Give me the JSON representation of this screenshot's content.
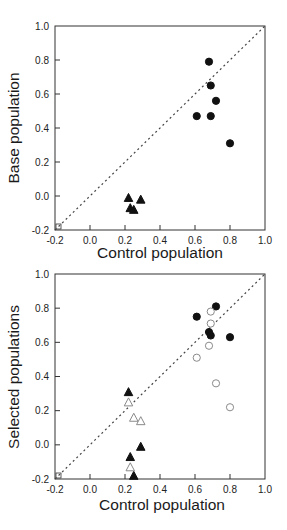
{
  "chart_data": [
    {
      "type": "scatter",
      "title": "",
      "xlabel": "Control population",
      "ylabel": "Base population",
      "xlim": [
        -0.2,
        1.0
      ],
      "ylim": [
        -0.2,
        1.0
      ],
      "xticks": [
        "-0.2",
        "0.0",
        "0.2",
        "0.4",
        "0.6",
        "0.8",
        "1.0"
      ],
      "yticks": [
        "-0.2",
        "0.0",
        "0.2",
        "0.4",
        "0.6",
        "0.8",
        "1.0"
      ],
      "grid": false,
      "legend": null,
      "reference_line": {
        "style": "dotted",
        "from": [
          -0.2,
          -0.2
        ],
        "to": [
          1.0,
          1.0
        ],
        "label": "y = x"
      },
      "series": [
        {
          "name": "filled circles",
          "marker": "circle",
          "filled": true,
          "points": [
            [
              0.68,
              0.79
            ],
            [
              0.69,
              0.65
            ],
            [
              0.72,
              0.56
            ],
            [
              0.61,
              0.47
            ],
            [
              0.69,
              0.47
            ],
            [
              0.8,
              0.31
            ]
          ]
        },
        {
          "name": "filled triangles",
          "marker": "triangle",
          "filled": true,
          "points": [
            [
              0.22,
              -0.01
            ],
            [
              0.29,
              -0.02
            ],
            [
              0.23,
              -0.07
            ],
            [
              0.25,
              -0.08
            ]
          ]
        }
      ]
    },
    {
      "type": "scatter",
      "title": "",
      "xlabel": "Control population",
      "ylabel": "Selected populations",
      "xlim": [
        -0.2,
        1.0
      ],
      "ylim": [
        -0.2,
        1.0
      ],
      "xticks": [
        "-0.2",
        "0.0",
        "0.2",
        "0.4",
        "0.6",
        "0.8",
        "1.0"
      ],
      "yticks": [
        "-0.2",
        "0.0",
        "0.2",
        "0.4",
        "0.6",
        "0.8",
        "1.0"
      ],
      "grid": false,
      "legend": null,
      "reference_line": {
        "style": "dotted",
        "from": [
          -0.2,
          -0.2
        ],
        "to": [
          1.0,
          1.0
        ],
        "label": "y = x"
      },
      "series": [
        {
          "name": "filled circles",
          "marker": "circle",
          "filled": true,
          "points": [
            [
              0.72,
              0.81
            ],
            [
              0.61,
              0.75
            ],
            [
              0.68,
              0.66
            ],
            [
              0.69,
              0.64
            ],
            [
              0.8,
              0.63
            ]
          ]
        },
        {
          "name": "open circles",
          "marker": "circle",
          "filled": false,
          "points": [
            [
              0.69,
              0.78
            ],
            [
              0.69,
              0.71
            ],
            [
              0.68,
              0.58
            ],
            [
              0.61,
              0.51
            ],
            [
              0.72,
              0.36
            ],
            [
              0.8,
              0.22
            ]
          ]
        },
        {
          "name": "filled triangles",
          "marker": "triangle",
          "filled": true,
          "points": [
            [
              0.22,
              0.31
            ],
            [
              0.29,
              -0.01
            ],
            [
              0.23,
              -0.07
            ],
            [
              0.25,
              -0.18
            ]
          ]
        },
        {
          "name": "open triangles",
          "marker": "triangle",
          "filled": false,
          "points": [
            [
              0.22,
              0.25
            ],
            [
              0.25,
              0.16
            ],
            [
              0.29,
              0.14
            ],
            [
              0.23,
              -0.13
            ]
          ]
        }
      ]
    }
  ],
  "colors": {
    "marker_filled": "#111111",
    "marker_open_stroke": "#8a8a8a",
    "axis": "#333333",
    "reference_line": "#444444"
  }
}
